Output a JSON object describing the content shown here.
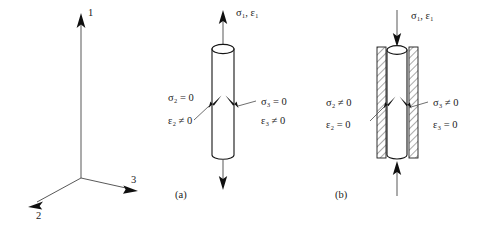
{
  "figure": {
    "background_color": "#ffffff",
    "line_color": "#141414",
    "width": 491,
    "height": 229
  },
  "axes": {
    "name": "principal-axes-triad",
    "labels": [
      {
        "id": "axis-1",
        "text": "1",
        "direction": "up"
      },
      {
        "id": "axis-2",
        "text": "2",
        "direction": "down-left"
      },
      {
        "id": "axis-3",
        "text": "3",
        "direction": "down-right"
      }
    ]
  },
  "panels": [
    {
      "id": "panel-a",
      "caption": "(a)",
      "condition": "uniaxial-stress",
      "axial_label": "σ₁, ε₁",
      "axial_load_direction": "tension",
      "confined": false,
      "lateral": [
        {
          "side": "left",
          "stress": "σ₂ = 0",
          "strain": "ε₂ ≠ 0"
        },
        {
          "side": "right",
          "stress": "σ₃ = 0",
          "strain": "ε₃ ≠ 0"
        }
      ]
    },
    {
      "id": "panel-b",
      "caption": "(b)",
      "condition": "uniaxial-strain",
      "axial_label": "σ₁, ε₁",
      "axial_load_direction": "compression",
      "confined": true,
      "lateral": [
        {
          "side": "left",
          "stress": "σ₂ ≠ 0",
          "strain": "ε₂ = 0"
        },
        {
          "side": "right",
          "stress": "σ₃ ≠ 0",
          "strain": "ε₃ = 0"
        }
      ]
    }
  ]
}
